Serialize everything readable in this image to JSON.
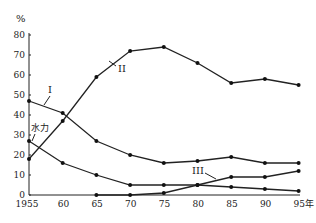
{
  "chart_data": {
    "type": "line",
    "title": "",
    "xlabel": "年",
    "ylabel": "%",
    "ylim": [
      0,
      80
    ],
    "x": [
      1955,
      1960,
      1965,
      1970,
      1975,
      1980,
      1985,
      1990,
      1995
    ],
    "x_tick_labels": [
      "1955",
      "60",
      "65",
      "70",
      "75",
      "80",
      "85",
      "90",
      "95年"
    ],
    "y_ticks": [
      0,
      10,
      20,
      30,
      40,
      50,
      60,
      70,
      80
    ],
    "grid": false,
    "legend": "inline labels",
    "series": [
      {
        "name": "I",
        "values": [
          47,
          41,
          27,
          20,
          16,
          17,
          19,
          16,
          16
        ]
      },
      {
        "name": "II",
        "values": [
          18,
          37,
          59,
          72,
          74,
          66,
          56,
          58,
          55
        ]
      },
      {
        "name": "III",
        "values": [
          null,
          null,
          0,
          0,
          1,
          5,
          9,
          9,
          12
        ]
      },
      {
        "name": "水力",
        "values": [
          27,
          16,
          10,
          5,
          5,
          5,
          4,
          3,
          2
        ]
      }
    ]
  },
  "labels": {
    "y_unit": "%",
    "series_I": "I",
    "series_II": "II",
    "series_III": "III",
    "hydro": "水力"
  }
}
